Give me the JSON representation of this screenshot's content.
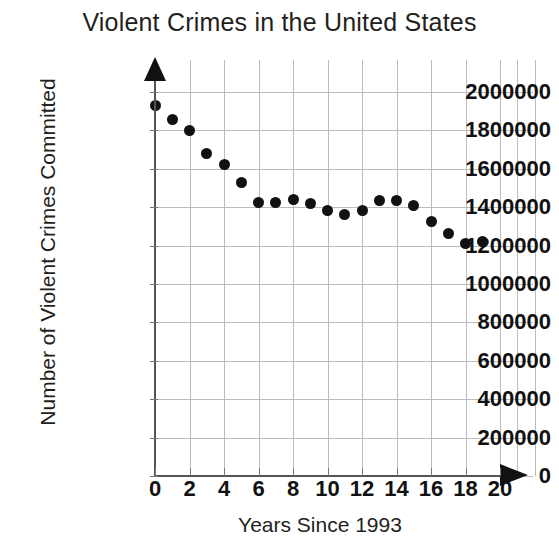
{
  "chart_data": {
    "type": "scatter",
    "title": "Violent Crimes in the United States",
    "xlabel": "Years Since 1993",
    "ylabel": "Number of Violent Crimes Committed",
    "x": [
      0,
      1,
      2,
      3,
      4,
      5,
      6,
      7,
      8,
      9,
      10,
      11,
      12,
      13,
      14,
      15,
      16,
      17,
      18,
      19
    ],
    "values": [
      1930000,
      1855000,
      1800000,
      1680000,
      1625000,
      1530000,
      1425000,
      1425000,
      1440000,
      1420000,
      1385000,
      1360000,
      1385000,
      1435000,
      1435000,
      1410000,
      1325000,
      1265000,
      1210000,
      1220000
    ],
    "xlim": [
      0,
      20
    ],
    "ylim": [
      0,
      2000000
    ],
    "xticks": [
      0,
      2,
      4,
      6,
      8,
      10,
      12,
      14,
      16,
      18,
      20
    ],
    "xtick_labels": [
      "0",
      "2",
      "4",
      "6",
      "8",
      "10",
      "12",
      "14",
      "16",
      "18",
      "20"
    ],
    "yticks": [
      0,
      200000,
      400000,
      600000,
      800000,
      1000000,
      1200000,
      1400000,
      1600000,
      1800000,
      2000000
    ],
    "ytick_labels": [
      "0",
      "200000",
      "400000",
      "600000",
      "800000",
      "1000000",
      "1200000",
      "1400000",
      "1600000",
      "1800000",
      "2000000"
    ],
    "grid": true,
    "legend": null,
    "marker_color": "#111111",
    "grid_color": "#bcbcbc",
    "axis_color": "#555555",
    "text_color": "#231f20",
    "background": "#ffffff"
  }
}
